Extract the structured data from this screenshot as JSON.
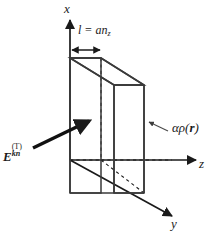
{
  "figure": {
    "background_color": "#ffffff",
    "line_color": "#1a1a1a",
    "face_color": "#ffffff"
  },
  "axes": {
    "x": {
      "label": "x"
    },
    "y": {
      "label": "y"
    },
    "z": {
      "label": "z"
    }
  },
  "annotations": {
    "thickness": {
      "base": "l = an",
      "subscript": "z",
      "full": "l = an_z"
    },
    "field": {
      "symbol": "E",
      "subscript": "kn",
      "superscript": "(T)",
      "full": "E_kn^(T)"
    },
    "density": {
      "prefix": "αρ(",
      "vector": "r",
      "suffix": ")",
      "full": "αρ(r)"
    }
  }
}
